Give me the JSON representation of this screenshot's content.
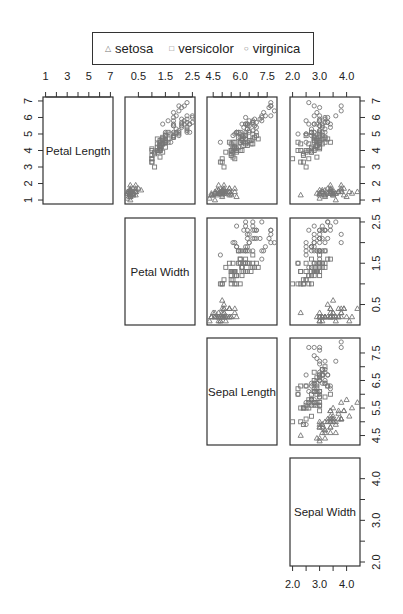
{
  "chart_data": {
    "type": "scatter",
    "subtype": "scatterplot-matrix (upper triangle)",
    "dataset_variables": [
      "Petal Length",
      "Petal Width",
      "Sepal Length",
      "Sepal Width"
    ],
    "legend": {
      "position": "top",
      "entries": [
        {
          "label": "setosa",
          "symbol": "triangle"
        },
        {
          "label": "versicolor",
          "symbol": "square"
        },
        {
          "label": "virginica",
          "symbol": "circle"
        }
      ]
    },
    "axes": {
      "Petal Length": {
        "range": [
          1,
          7
        ],
        "ticks_top": [
          "1",
          "3",
          "5",
          "7"
        ],
        "ticks_right": [
          "1",
          "2",
          "3",
          "4",
          "5",
          "6",
          "7"
        ]
      },
      "Petal Width": {
        "range": [
          0.1,
          2.5
        ],
        "ticks_top": [
          "0.5",
          "1.5",
          "2.5"
        ],
        "ticks_right": [
          "0.5",
          "1.5",
          "2.5"
        ]
      },
      "Sepal Length": {
        "range": [
          4.3,
          7.9
        ],
        "ticks_top": [
          "4.5",
          "6.0",
          "7.5"
        ],
        "ticks_right": [
          "4.5",
          "5.5",
          "6.5",
          "7.5"
        ]
      },
      "Sepal Width": {
        "range": [
          2.0,
          4.4
        ],
        "ticks_bottom": [
          "2.0",
          "3.0",
          "4.0"
        ],
        "ticks_right": [
          "2.0",
          "3.0",
          "4.0"
        ]
      }
    },
    "grid": false,
    "series": [
      {
        "name": "setosa",
        "color": "#777777",
        "points": [
          [
            5.1,
            3.5,
            1.4,
            0.2
          ],
          [
            4.9,
            3.0,
            1.4,
            0.2
          ],
          [
            4.7,
            3.2,
            1.3,
            0.2
          ],
          [
            4.6,
            3.1,
            1.5,
            0.2
          ],
          [
            5.0,
            3.6,
            1.4,
            0.2
          ],
          [
            5.4,
            3.9,
            1.7,
            0.4
          ],
          [
            4.6,
            3.4,
            1.4,
            0.3
          ],
          [
            5.0,
            3.4,
            1.5,
            0.2
          ],
          [
            4.4,
            2.9,
            1.4,
            0.2
          ],
          [
            4.9,
            3.1,
            1.5,
            0.1
          ],
          [
            5.4,
            3.7,
            1.5,
            0.2
          ],
          [
            4.8,
            3.4,
            1.6,
            0.2
          ],
          [
            4.8,
            3.0,
            1.4,
            0.1
          ],
          [
            4.3,
            3.0,
            1.1,
            0.1
          ],
          [
            5.8,
            4.0,
            1.2,
            0.2
          ],
          [
            5.7,
            4.4,
            1.5,
            0.4
          ],
          [
            5.4,
            3.9,
            1.3,
            0.4
          ],
          [
            5.1,
            3.5,
            1.4,
            0.3
          ],
          [
            5.7,
            3.8,
            1.7,
            0.3
          ],
          [
            5.1,
            3.8,
            1.5,
            0.3
          ],
          [
            5.4,
            3.4,
            1.7,
            0.2
          ],
          [
            5.1,
            3.7,
            1.5,
            0.4
          ],
          [
            4.6,
            3.6,
            1.0,
            0.2
          ],
          [
            5.1,
            3.3,
            1.7,
            0.5
          ],
          [
            4.8,
            3.4,
            1.9,
            0.2
          ],
          [
            5.0,
            3.0,
            1.6,
            0.2
          ],
          [
            5.0,
            3.4,
            1.6,
            0.4
          ],
          [
            5.2,
            3.5,
            1.5,
            0.2
          ],
          [
            5.2,
            3.4,
            1.4,
            0.2
          ],
          [
            4.7,
            3.2,
            1.6,
            0.2
          ],
          [
            4.8,
            3.1,
            1.6,
            0.2
          ],
          [
            5.4,
            3.4,
            1.5,
            0.4
          ],
          [
            5.2,
            4.1,
            1.5,
            0.1
          ],
          [
            5.5,
            4.2,
            1.4,
            0.2
          ],
          [
            4.9,
            3.1,
            1.5,
            0.2
          ],
          [
            5.0,
            3.2,
            1.2,
            0.2
          ],
          [
            5.5,
            3.5,
            1.3,
            0.2
          ],
          [
            4.9,
            3.6,
            1.4,
            0.1
          ],
          [
            4.4,
            3.0,
            1.3,
            0.2
          ],
          [
            5.1,
            3.4,
            1.5,
            0.2
          ],
          [
            5.0,
            3.5,
            1.3,
            0.3
          ],
          [
            4.5,
            2.3,
            1.3,
            0.3
          ],
          [
            4.4,
            3.2,
            1.3,
            0.2
          ],
          [
            5.0,
            3.5,
            1.6,
            0.6
          ],
          [
            5.1,
            3.8,
            1.9,
            0.4
          ],
          [
            4.8,
            3.0,
            1.4,
            0.3
          ],
          [
            5.1,
            3.8,
            1.6,
            0.2
          ],
          [
            4.6,
            3.2,
            1.4,
            0.2
          ],
          [
            5.3,
            3.7,
            1.5,
            0.2
          ],
          [
            5.0,
            3.3,
            1.4,
            0.2
          ]
        ]
      },
      {
        "name": "versicolor",
        "color": "#777777",
        "points": [
          [
            7.0,
            3.2,
            4.7,
            1.4
          ],
          [
            6.4,
            3.2,
            4.5,
            1.5
          ],
          [
            6.9,
            3.1,
            4.9,
            1.5
          ],
          [
            5.5,
            2.3,
            4.0,
            1.3
          ],
          [
            6.5,
            2.8,
            4.6,
            1.5
          ],
          [
            5.7,
            2.8,
            4.5,
            1.3
          ],
          [
            6.3,
            3.3,
            4.7,
            1.6
          ],
          [
            4.9,
            2.4,
            3.3,
            1.0
          ],
          [
            6.6,
            2.9,
            4.6,
            1.3
          ],
          [
            5.2,
            2.7,
            3.9,
            1.4
          ],
          [
            5.0,
            2.0,
            3.5,
            1.0
          ],
          [
            5.9,
            3.0,
            4.2,
            1.5
          ],
          [
            6.0,
            2.2,
            4.0,
            1.0
          ],
          [
            6.1,
            2.9,
            4.7,
            1.4
          ],
          [
            5.6,
            2.9,
            3.6,
            1.3
          ],
          [
            6.7,
            3.1,
            4.4,
            1.4
          ],
          [
            5.6,
            3.0,
            4.5,
            1.5
          ],
          [
            5.8,
            2.7,
            4.1,
            1.0
          ],
          [
            6.2,
            2.2,
            4.5,
            1.5
          ],
          [
            5.6,
            2.5,
            3.9,
            1.1
          ],
          [
            5.9,
            3.2,
            4.8,
            1.8
          ],
          [
            6.1,
            2.8,
            4.0,
            1.3
          ],
          [
            6.3,
            2.5,
            4.9,
            1.5
          ],
          [
            6.1,
            2.8,
            4.7,
            1.2
          ],
          [
            6.4,
            2.9,
            4.3,
            1.3
          ],
          [
            6.6,
            3.0,
            4.4,
            1.4
          ],
          [
            6.8,
            2.8,
            4.8,
            1.4
          ],
          [
            6.7,
            3.0,
            5.0,
            1.7
          ],
          [
            6.0,
            2.9,
            4.5,
            1.5
          ],
          [
            5.7,
            2.6,
            3.5,
            1.0
          ],
          [
            5.5,
            2.4,
            3.8,
            1.1
          ],
          [
            5.5,
            2.4,
            3.7,
            1.0
          ],
          [
            5.8,
            2.7,
            3.9,
            1.2
          ],
          [
            6.0,
            2.7,
            5.1,
            1.6
          ],
          [
            5.4,
            3.0,
            4.5,
            1.5
          ],
          [
            6.0,
            3.4,
            4.5,
            1.6
          ],
          [
            6.7,
            3.1,
            4.7,
            1.5
          ],
          [
            6.3,
            2.3,
            4.4,
            1.3
          ],
          [
            5.6,
            3.0,
            4.1,
            1.3
          ],
          [
            5.5,
            2.5,
            4.0,
            1.3
          ],
          [
            5.5,
            2.6,
            4.4,
            1.2
          ],
          [
            6.1,
            3.0,
            4.6,
            1.4
          ],
          [
            5.8,
            2.6,
            4.0,
            1.2
          ],
          [
            5.0,
            2.3,
            3.3,
            1.0
          ],
          [
            5.6,
            2.7,
            4.2,
            1.3
          ],
          [
            5.7,
            3.0,
            4.2,
            1.2
          ],
          [
            5.7,
            2.9,
            4.2,
            1.3
          ],
          [
            6.2,
            2.9,
            4.3,
            1.3
          ],
          [
            5.1,
            2.5,
            3.0,
            1.1
          ],
          [
            5.7,
            2.8,
            4.1,
            1.3
          ]
        ]
      },
      {
        "name": "virginica",
        "color": "#777777",
        "points": [
          [
            6.3,
            3.3,
            6.0,
            2.5
          ],
          [
            5.8,
            2.7,
            5.1,
            1.9
          ],
          [
            7.1,
            3.0,
            5.9,
            2.1
          ],
          [
            6.3,
            2.9,
            5.6,
            1.8
          ],
          [
            6.5,
            3.0,
            5.8,
            2.2
          ],
          [
            7.6,
            3.0,
            6.6,
            2.1
          ],
          [
            4.9,
            2.5,
            4.5,
            1.7
          ],
          [
            7.3,
            2.9,
            6.3,
            1.8
          ],
          [
            6.7,
            2.5,
            5.8,
            1.8
          ],
          [
            7.2,
            3.6,
            6.1,
            2.5
          ],
          [
            6.5,
            3.2,
            5.1,
            2.0
          ],
          [
            6.4,
            2.7,
            5.3,
            1.9
          ],
          [
            6.8,
            3.0,
            5.5,
            2.1
          ],
          [
            5.7,
            2.5,
            5.0,
            2.0
          ],
          [
            5.8,
            2.8,
            5.1,
            2.4
          ],
          [
            6.4,
            3.2,
            5.3,
            2.3
          ],
          [
            6.5,
            3.0,
            5.5,
            1.8
          ],
          [
            7.7,
            3.8,
            6.7,
            2.2
          ],
          [
            7.7,
            2.6,
            6.9,
            2.3
          ],
          [
            6.0,
            2.2,
            5.0,
            1.5
          ],
          [
            6.9,
            3.2,
            5.7,
            2.3
          ],
          [
            5.6,
            2.8,
            4.9,
            2.0
          ],
          [
            7.7,
            2.8,
            6.7,
            2.0
          ],
          [
            6.3,
            2.7,
            4.9,
            1.8
          ],
          [
            6.7,
            3.3,
            5.7,
            2.1
          ],
          [
            7.2,
            3.2,
            6.0,
            1.8
          ],
          [
            6.2,
            2.8,
            4.8,
            1.8
          ],
          [
            6.1,
            3.0,
            4.9,
            1.8
          ],
          [
            6.4,
            2.8,
            5.6,
            2.1
          ],
          [
            7.2,
            3.0,
            5.8,
            1.6
          ],
          [
            7.4,
            2.8,
            6.1,
            1.9
          ],
          [
            7.9,
            3.8,
            6.4,
            2.0
          ],
          [
            6.4,
            2.8,
            5.6,
            2.2
          ],
          [
            6.3,
            2.8,
            5.1,
            1.5
          ],
          [
            6.1,
            2.6,
            5.6,
            1.4
          ],
          [
            7.7,
            3.0,
            6.1,
            2.3
          ],
          [
            6.3,
            3.4,
            5.6,
            2.4
          ],
          [
            6.4,
            3.1,
            5.5,
            1.8
          ],
          [
            6.0,
            3.0,
            4.8,
            1.8
          ],
          [
            6.9,
            3.1,
            5.4,
            2.1
          ],
          [
            6.7,
            3.1,
            5.6,
            2.4
          ],
          [
            6.9,
            3.1,
            5.1,
            2.3
          ],
          [
            5.8,
            2.7,
            5.1,
            1.9
          ],
          [
            6.8,
            3.2,
            5.9,
            2.3
          ],
          [
            6.7,
            3.3,
            5.7,
            2.5
          ],
          [
            6.7,
            3.0,
            5.2,
            2.3
          ],
          [
            6.3,
            2.5,
            5.0,
            1.9
          ],
          [
            6.5,
            3.0,
            5.2,
            2.0
          ],
          [
            6.2,
            3.4,
            5.4,
            2.3
          ],
          [
            5.9,
            3.0,
            5.1,
            1.8
          ]
        ]
      }
    ],
    "point_columns": [
      "Sepal Length",
      "Sepal Width",
      "Petal Length",
      "Petal Width"
    ]
  }
}
